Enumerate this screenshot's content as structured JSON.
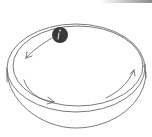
{
  "illustration": {
    "subject": "ball rolling inside a circular dish",
    "caption": "",
    "colors": {
      "stroke": "#6b6b6b",
      "ball": "#3a3a3a",
      "ball_highlight": "#d8d8d8",
      "background": "#ffffff",
      "top_bar": "#8a8a8a"
    },
    "elements": [
      {
        "name": "dish-rim-outer",
        "type": "ellipse"
      },
      {
        "name": "dish-rim-inner",
        "type": "ellipse"
      },
      {
        "name": "dish-wall-bottom",
        "type": "arc"
      },
      {
        "name": "ball",
        "type": "circle"
      },
      {
        "name": "motion-arrow-upper-left",
        "direction": "counterclockwise"
      },
      {
        "name": "motion-arrow-lower-left",
        "direction": "counterclockwise"
      },
      {
        "name": "motion-arrow-right",
        "direction": "counterclockwise"
      }
    ]
  }
}
